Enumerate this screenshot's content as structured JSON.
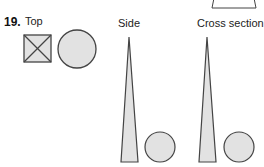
{
  "problem": {
    "number": "19.",
    "labels": {
      "top": "Top",
      "side": "Side",
      "cross_section": "Cross section"
    },
    "colors": {
      "fill": "#e2e2e2",
      "stroke": "#444444"
    }
  }
}
